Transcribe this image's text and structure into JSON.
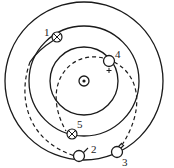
{
  "diagram": {
    "type": "concentric-orbits",
    "center": {
      "x": 84,
      "y": 81,
      "symbol": "dot-in-circle"
    },
    "circles": [
      {
        "name": "outer",
        "r": 79
      },
      {
        "name": "middle",
        "r": 55
      },
      {
        "name": "inner",
        "r": 34
      }
    ],
    "points": [
      {
        "id": "1",
        "label": "1",
        "symbol": "cross-in-circle",
        "x": 57,
        "y": 37
      },
      {
        "id": "2",
        "label": "2",
        "symbol": "open-circle",
        "x": 79,
        "y": 156
      },
      {
        "id": "3",
        "label": "3",
        "symbol": "open-circle",
        "x": 117,
        "y": 152
      },
      {
        "id": "4",
        "label": "4",
        "symbol": "open-circle-plus",
        "x": 109,
        "y": 61
      },
      {
        "id": "5",
        "label": "5",
        "symbol": "cross-in-circle",
        "x": 72,
        "y": 134
      }
    ],
    "paths": [
      {
        "name": "transfer-1-to-2",
        "style": "dashed"
      },
      {
        "name": "transfer-4-to-3",
        "style": "dashed"
      },
      {
        "name": "transfer-4-to-5",
        "style": "dashed"
      }
    ]
  }
}
